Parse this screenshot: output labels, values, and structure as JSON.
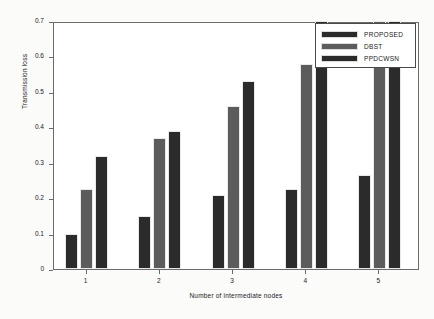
{
  "chart_data": {
    "type": "bar",
    "title": "",
    "xlabel": "Number of  intermediate nodes",
    "ylabel": "Transmission loss",
    "categories": [
      "1",
      "2",
      "3",
      "4",
      "5"
    ],
    "ylim": [
      0,
      0.7
    ],
    "yticks": [
      "0",
      "0.1",
      "0.2",
      "0.3",
      "0.4",
      "0.5",
      "0.6",
      "0.7"
    ],
    "ytick_values": [
      0,
      0.1,
      0.2,
      0.3,
      0.4,
      0.5,
      0.6,
      0.7
    ],
    "grid": false,
    "legend_position": "top-right",
    "series": [
      {
        "name": "PROPOSED",
        "color": "#2b2b2b",
        "values": [
          0.1,
          0.15,
          0.21,
          0.225,
          0.265
        ]
      },
      {
        "name": "DBST",
        "color": "#5c5c5c",
        "values": [
          0.225,
          0.37,
          0.46,
          0.58,
          0.7
        ]
      },
      {
        "name": "PPDCWSN",
        "color": "#2b2b2b",
        "values": [
          0.32,
          0.39,
          0.53,
          0.7,
          0.7
        ]
      }
    ]
  },
  "axis": {
    "frame_color": "#6b6b6b",
    "text_color": "#1a1a1a"
  }
}
